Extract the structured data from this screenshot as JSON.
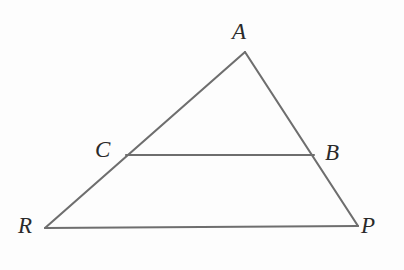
{
  "figure": {
    "kind": "geometry-diagram",
    "background_color": "#fdfdfd",
    "stroke_color": "#6e6e6e",
    "label_color": "#2a2a2a",
    "stroke_width": 2.1,
    "width": 404,
    "height": 270
  },
  "points": {
    "A": {
      "label": "A",
      "x": 245,
      "y": 52,
      "label_x": 232,
      "label_y": 20
    },
    "B": {
      "label": "B",
      "x": 314,
      "y": 155,
      "label_x": 325,
      "label_y": 141
    },
    "C": {
      "label": "C",
      "x": 126,
      "y": 155,
      "label_x": 95,
      "label_y": 138
    },
    "R": {
      "label": "R",
      "x": 45,
      "y": 228,
      "label_x": 18,
      "label_y": 214
    },
    "P": {
      "label": "P",
      "x": 358,
      "y": 226,
      "label_x": 361,
      "label_y": 214
    }
  },
  "segments": [
    {
      "name": "side-A-R",
      "from": "A",
      "to": "R",
      "x1": 245,
      "y1": 52,
      "x2": 45,
      "y2": 228
    },
    {
      "name": "side-A-P",
      "from": "A",
      "to": "P",
      "x1": 245,
      "y1": 52,
      "x2": 358,
      "y2": 226
    },
    {
      "name": "base-R-P",
      "from": "R",
      "to": "P",
      "x1": 45,
      "y1": 228,
      "x2": 358,
      "y2": 226
    },
    {
      "name": "segment-C-B",
      "from": "C",
      "to": "B",
      "x1": 126,
      "y1": 155,
      "x2": 314,
      "y2": 155
    }
  ]
}
